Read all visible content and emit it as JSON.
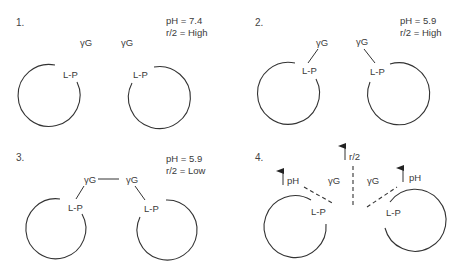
{
  "panels": [
    {
      "number": "1.",
      "conditions": [
        "pH = 7.4",
        "r/2 = High"
      ],
      "ligand_labels": [
        "γG",
        "γG"
      ],
      "site_labels": [
        "L-P",
        "L-P"
      ],
      "state": "unbound"
    },
    {
      "number": "2.",
      "conditions": [
        "pH = 5.9",
        "r/2 = High"
      ],
      "ligand_labels": [
        "γG",
        "γG"
      ],
      "site_labels": [
        "L-P",
        "L-P"
      ],
      "state": "each γG bound to L-P"
    },
    {
      "number": "3.",
      "conditions": [
        "pH = 5.9",
        "r/2 = Low"
      ],
      "ligand_labels": [
        "γG",
        "γG"
      ],
      "site_labels": [
        "L-P",
        "L-P"
      ],
      "state": "γG–γG bridged"
    },
    {
      "number": "4.",
      "arrows": [
        "pH",
        "r/2",
        "pH"
      ],
      "ligand_labels": [
        "γG",
        "γG"
      ],
      "site_labels": [
        "L-P",
        "L-P"
      ],
      "state": "dissociation (dashed bonds)"
    }
  ]
}
